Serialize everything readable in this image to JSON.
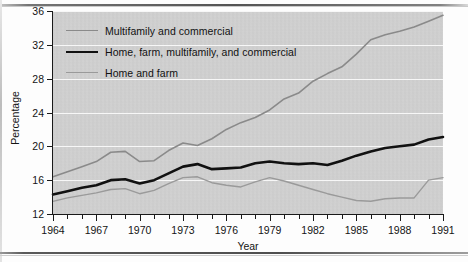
{
  "figure": {
    "clipped_header_text": "",
    "background_color": "#d2d2d2",
    "frame_color": "#1a1a1a"
  },
  "axes": {
    "y_axis_title": "Percentage",
    "x_axis_title": "Year",
    "y_ticks": [
      12,
      16,
      20,
      24,
      28,
      32,
      36
    ],
    "x_major_ticks": [
      1964,
      1967,
      1970,
      1973,
      1976,
      1979,
      1982,
      1985,
      1988,
      1991
    ],
    "y_min": 12,
    "y_max": 36,
    "x_min": 1964,
    "x_max": 1991
  },
  "legend": {
    "position": "inside-top-left",
    "items": [
      {
        "label": "Multifamily and commercial",
        "color": "#8a8a8a",
        "width": 1.6
      },
      {
        "label": "Home, farm, multifamily, and commercial",
        "color": "#111111",
        "width": 2.6
      },
      {
        "label": "Home and farm",
        "color": "#9a9a9a",
        "width": 1.4
      }
    ]
  },
  "chart_data": {
    "type": "line",
    "title": "",
    "xlabel": "Year",
    "ylabel": "Percentage",
    "xlim": [
      1964,
      1991
    ],
    "ylim": [
      12,
      36
    ],
    "grid": true,
    "legend_position": "upper left",
    "x": [
      1964,
      1965,
      1966,
      1967,
      1968,
      1969,
      1970,
      1971,
      1972,
      1973,
      1974,
      1975,
      1976,
      1977,
      1978,
      1979,
      1980,
      1981,
      1982,
      1983,
      1984,
      1985,
      1986,
      1987,
      1988,
      1989,
      1990,
      1991
    ],
    "series": [
      {
        "name": "Multifamily and commercial",
        "color": "#8a8a8a",
        "values": [
          16.4,
          17.0,
          17.6,
          18.2,
          19.3,
          19.4,
          18.2,
          18.3,
          19.5,
          20.4,
          20.1,
          20.9,
          22.0,
          22.8,
          23.4,
          24.3,
          25.6,
          26.3,
          27.7,
          28.6,
          29.4,
          30.9,
          32.6,
          33.2,
          33.6,
          34.1,
          34.8,
          35.5
        ]
      },
      {
        "name": "Home, farm, multifamily, and commercial",
        "color": "#111111",
        "values": [
          14.3,
          14.7,
          15.1,
          15.4,
          16.0,
          16.1,
          15.6,
          16.0,
          16.8,
          17.6,
          17.9,
          17.3,
          17.4,
          17.5,
          18.0,
          18.2,
          18.0,
          17.9,
          18.0,
          17.8,
          18.3,
          18.9,
          19.4,
          19.8,
          20.0,
          20.2,
          20.8,
          21.1
        ]
      },
      {
        "name": "Home and farm",
        "color": "#9a9a9a",
        "values": [
          13.5,
          13.9,
          14.2,
          14.5,
          14.9,
          15.0,
          14.4,
          14.8,
          15.6,
          16.3,
          16.4,
          15.7,
          15.4,
          15.2,
          15.8,
          16.3,
          15.9,
          15.4,
          14.9,
          14.4,
          14.0,
          13.6,
          13.5,
          13.8,
          13.9,
          13.9,
          16.0,
          16.3
        ]
      }
    ]
  }
}
